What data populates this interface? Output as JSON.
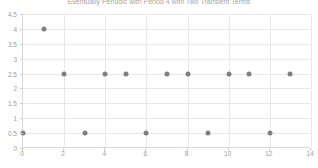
{
  "chart_data": {
    "type": "scatter",
    "title": "Eventually Periodic with Period 4 with Two Transient Terms",
    "xlabel": "",
    "ylabel": "",
    "xlim": [
      0,
      14
    ],
    "ylim": [
      0,
      4.5
    ],
    "grid": true,
    "legend": "none",
    "marker_color": "#7f7f7f",
    "x": [
      0,
      1,
      2,
      3,
      4,
      5,
      6,
      7,
      8,
      9,
      10,
      11,
      12,
      13
    ],
    "y": [
      0.5,
      4,
      2.5,
      0.5,
      2.5,
      2.5,
      0.5,
      2.5,
      2.5,
      0.5,
      2.5,
      2.5,
      0.5,
      2.5
    ],
    "points": [
      {
        "x": 0,
        "y": 0.5
      },
      {
        "x": 1,
        "y": 4
      },
      {
        "x": 2,
        "y": 2.5
      },
      {
        "x": 3,
        "y": 0.5
      },
      {
        "x": 4,
        "y": 2.5
      },
      {
        "x": 5,
        "y": 2.5
      },
      {
        "x": 6,
        "y": 0.5
      },
      {
        "x": 7,
        "y": 2.5
      },
      {
        "x": 8,
        "y": 2.5
      },
      {
        "x": 9,
        "y": 0.5
      },
      {
        "x": 10,
        "y": 2.5
      },
      {
        "x": 11,
        "y": 2.5
      },
      {
        "x": 12,
        "y": 0.5
      },
      {
        "x": 13,
        "y": 2.5
      }
    ],
    "xticks": [
      0,
      2,
      4,
      6,
      8,
      10,
      12,
      14
    ],
    "xticklabels": [
      "0",
      "2",
      "4",
      "6",
      "8",
      "10",
      "12",
      "14"
    ],
    "yticks": [
      0,
      0.5,
      1,
      1.5,
      2,
      2.5,
      3,
      3.5,
      4,
      4.5
    ],
    "yticklabels": [
      "0",
      "0.5",
      "1",
      "1.5",
      "2",
      "2.5",
      "3",
      "3.5",
      "4",
      "4.5"
    ]
  }
}
